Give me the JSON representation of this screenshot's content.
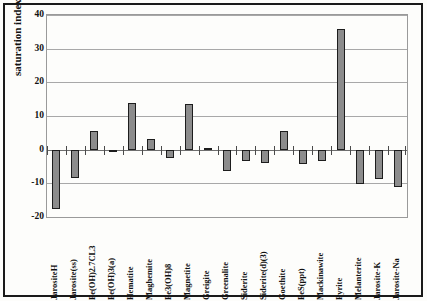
{
  "chart_data": {
    "type": "bar",
    "title": "",
    "xlabel": "",
    "ylabel": "saturation index SI",
    "ylim": [
      -20,
      40
    ],
    "yticks": [
      40,
      30,
      20,
      10,
      0,
      -10,
      -20
    ],
    "ytick_labels": [
      "40",
      "30",
      "20",
      "10",
      "0",
      "-10",
      "-20"
    ],
    "grid": true,
    "legend": "none",
    "categories": [
      "JarositeH",
      "Jarosite(ss)",
      "Fe(OH)2.7CL3",
      "Fe(OH)3(a)",
      "Hematite",
      "Maghemite",
      "Fe3(OH)8",
      "Magnetite",
      "Greigite",
      "Greenalite",
      "Siderite",
      "Siderite(d)(3)",
      "Goethite",
      "FeS(ppt)",
      "Mackinawite",
      "Pyrite",
      "Melanterite",
      "Jarosite-K",
      "Jarosite-Na"
    ],
    "values": [
      -17.5,
      -8.4,
      5.5,
      -0.3,
      13.8,
      3.3,
      -2.6,
      13.7,
      0.5,
      -6.3,
      -3.3,
      -4.0,
      5.4,
      -4.3,
      -3.4,
      35.7,
      -10.1,
      -8.6,
      -11.0
    ],
    "bar_fill_color": "#8c8c8c",
    "bar_edge_color": "#1d1d1d",
    "gridline_color": "#a8a8a8",
    "axis_color": "#1a1a1a",
    "background_color": "#fdfdfb"
  }
}
